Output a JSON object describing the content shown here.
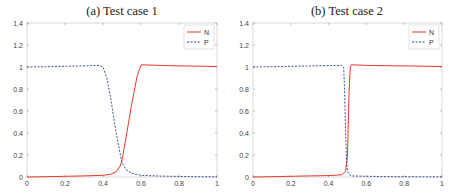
{
  "chart_data": [
    {
      "type": "line",
      "title": "(a) Test case 1",
      "xlabel": "",
      "ylabel": "",
      "xlim": [
        0,
        1
      ],
      "ylim": [
        0,
        1.4
      ],
      "xticks": [
        "0",
        "0.2",
        "0.4",
        "0.6",
        "0.8",
        "1"
      ],
      "yticks": [
        "0",
        "0.2",
        "0.4",
        "0.6",
        "0.8",
        "1",
        "1.2",
        "1.4"
      ],
      "grid": false,
      "legend_position": "upper right",
      "series": [
        {
          "name": "N",
          "color": "#e8392b",
          "style": "solid",
          "x": [
            0,
            0.1,
            0.2,
            0.3,
            0.4,
            0.44,
            0.47,
            0.49,
            0.5,
            0.52,
            0.55,
            0.58,
            0.6,
            0.7,
            0.8,
            0.9,
            1.0
          ],
          "y": [
            0,
            0.003,
            0.006,
            0.01,
            0.015,
            0.025,
            0.05,
            0.1,
            0.15,
            0.35,
            0.65,
            0.92,
            1.02,
            1.015,
            1.01,
            1.008,
            1.005
          ]
        },
        {
          "name": "P",
          "color": "#2b3f8c",
          "style": "dashed",
          "x": [
            0,
            0.1,
            0.2,
            0.3,
            0.38,
            0.4,
            0.42,
            0.44,
            0.46,
            0.48,
            0.5,
            0.52,
            0.55,
            0.6,
            0.7,
            0.8,
            0.9,
            1.0
          ],
          "y": [
            1.0,
            1.003,
            1.006,
            1.01,
            1.015,
            1.0,
            0.9,
            0.72,
            0.5,
            0.3,
            0.13,
            0.07,
            0.035,
            0.015,
            0.008,
            0.005,
            0.003,
            0.002
          ]
        }
      ]
    },
    {
      "type": "line",
      "title": "(b) Test case 2",
      "xlabel": "",
      "ylabel": "",
      "xlim": [
        0,
        1
      ],
      "ylim": [
        0,
        1.4
      ],
      "xticks": [
        "0",
        "0.2",
        "0.4",
        "0.6",
        "0.8",
        "1"
      ],
      "yticks": [
        "0",
        "0.2",
        "0.4",
        "0.6",
        "0.8",
        "1",
        "1.2",
        "1.4"
      ],
      "grid": false,
      "legend_position": "upper right",
      "series": [
        {
          "name": "N",
          "color": "#e8392b",
          "style": "solid",
          "x": [
            0,
            0.1,
            0.2,
            0.3,
            0.4,
            0.47,
            0.49,
            0.5,
            0.505,
            0.51,
            0.515,
            0.52,
            0.6,
            0.7,
            0.8,
            0.9,
            1.0
          ],
          "y": [
            0,
            0.003,
            0.006,
            0.01,
            0.013,
            0.02,
            0.05,
            0.2,
            0.55,
            0.85,
            1.0,
            1.02,
            1.015,
            1.012,
            1.01,
            1.007,
            1.005
          ]
        },
        {
          "name": "P",
          "color": "#2b3f8c",
          "style": "dashed",
          "x": [
            0,
            0.1,
            0.2,
            0.3,
            0.4,
            0.47,
            0.48,
            0.485,
            0.49,
            0.495,
            0.5,
            0.51,
            0.52,
            0.6,
            0.7,
            0.8,
            0.9,
            1.0
          ],
          "y": [
            1.0,
            1.003,
            1.006,
            1.01,
            1.013,
            1.015,
            1.0,
            0.75,
            0.4,
            0.15,
            0.05,
            0.02,
            0.01,
            0.006,
            0.004,
            0.003,
            0.002,
            0.001
          ]
        }
      ]
    }
  ]
}
